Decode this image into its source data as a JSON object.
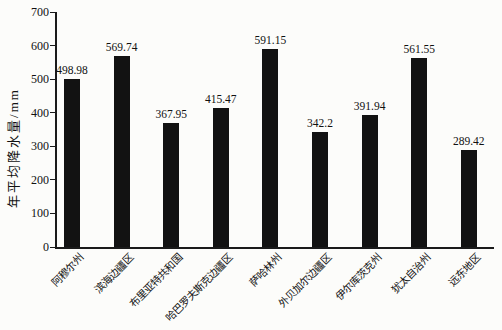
{
  "chart_data": {
    "type": "bar",
    "title": "",
    "xlabel": "",
    "ylabel": "年平均降水量/mm",
    "categories": [
      "阿穆尔州",
      "滨海边疆区",
      "布里亚特共和国",
      "哈巴罗夫斯克边疆区",
      "萨哈林州",
      "外贝加尔边疆区",
      "伊尔库茨克州",
      "犹太自治州",
      "远东地区"
    ],
    "values": [
      498.98,
      569.74,
      367.95,
      415.47,
      591.15,
      342.2,
      391.94,
      561.55,
      289.42
    ],
    "value_labels": [
      "498.98",
      "569.74",
      "367.95",
      "415.47",
      "591.15",
      "342.2",
      "391.94",
      "561.55",
      "289.42"
    ],
    "ylim": [
      0,
      700
    ],
    "yticks": [
      0,
      100,
      200,
      300,
      400,
      500,
      600,
      700
    ],
    "grid": false,
    "legend": false,
    "bar_color": "#121212",
    "axis_color": "#1a1a1a",
    "text_color": "#111111",
    "background_color": "#fcfcfa"
  }
}
